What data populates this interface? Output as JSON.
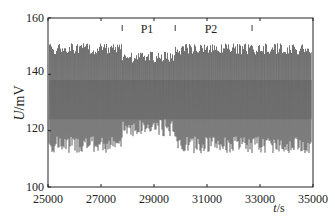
{
  "chart_data": {
    "type": "line",
    "title": "",
    "xlabel": "t/s",
    "ylabel": "U/mV",
    "xlim": [
      25000,
      35000
    ],
    "ylim": [
      100,
      160
    ],
    "xticks": [
      25000,
      27000,
      29000,
      31000,
      33000,
      35000
    ],
    "yticks": [
      100,
      120,
      140,
      160
    ],
    "grid": false,
    "annotations": [
      {
        "label": "P1",
        "x_start": 27800,
        "x_end": 29800
      },
      {
        "label": "P2",
        "x_start": 29800,
        "x_end": 32700
      }
    ],
    "series": [
      {
        "name": "U",
        "description": "Dense oscillating voltage signal between ~112 and ~151 mV; in P1 region amplitude reduced (~118-148 mV)",
        "segments": [
          {
            "x_range": [
              25000,
              27800
            ],
            "min": 112,
            "max": 151,
            "center": 131
          },
          {
            "x_range": [
              27800,
              29800
            ],
            "min": 118,
            "max": 148,
            "center": 132
          },
          {
            "x_range": [
              29800,
              35000
            ],
            "min": 112,
            "max": 151,
            "center": 131
          }
        ]
      }
    ]
  },
  "labels": {
    "ylabel_italic": "U",
    "ylabel_unit": "/mV",
    "xlabel_italic": "t",
    "xlabel_unit": "/s",
    "p1": "P1",
    "p2": "P2"
  },
  "ticks": {
    "x": [
      "25000",
      "27000",
      "29000",
      "31000",
      "33000",
      "35000"
    ],
    "y": [
      "160",
      "140",
      "120",
      "100"
    ]
  }
}
